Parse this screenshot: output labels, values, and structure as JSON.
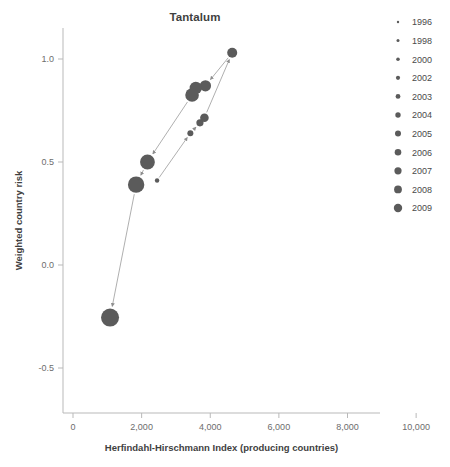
{
  "chart_data": {
    "type": "scatter",
    "title": "Tantalum",
    "xlabel": "Herfindahl-Hirschmann Index (producing countries)",
    "ylabel": "Weighted country risk",
    "xlim": [
      0,
      10400
    ],
    "ylim": [
      -0.72,
      1.16
    ],
    "xticks": [
      0,
      2000,
      4000,
      6000,
      8000,
      10000
    ],
    "xticklabels": [
      "0",
      "2,000",
      "4,000",
      "6,000",
      "8,000",
      "10,000"
    ],
    "yticks": [
      1.0,
      0.5,
      0.0,
      -0.5
    ],
    "yticklabels": [
      "1.0",
      "0.5",
      "0.0",
      "-0.5"
    ],
    "grid": false,
    "legend_position": "right",
    "marker_color": "#5b5b5b",
    "connector_color": "#9a9a9a",
    "series_name": "Tantalum trajectory",
    "points": [
      {
        "label": "1996",
        "x": 2450,
        "y": 0.41,
        "size": 2.2
      },
      {
        "label": "1998",
        "x": 3420,
        "y": 0.64,
        "size": 3.0
      },
      {
        "label": "2000",
        "x": 3700,
        "y": 0.69,
        "size": 3.6
      },
      {
        "label": "2002",
        "x": 3830,
        "y": 0.715,
        "size": 4.3
      },
      {
        "label": "2003",
        "x": 4640,
        "y": 1.03,
        "size": 5.0
      },
      {
        "label": "2004",
        "x": 3860,
        "y": 0.87,
        "size": 5.6
      },
      {
        "label": "2005",
        "x": 3580,
        "y": 0.86,
        "size": 6.2
      },
      {
        "label": "2006",
        "x": 3470,
        "y": 0.825,
        "size": 6.8
      },
      {
        "label": "2007",
        "x": 2170,
        "y": 0.5,
        "size": 7.4
      },
      {
        "label": "2008",
        "x": 1840,
        "y": 0.39,
        "size": 8.2
      },
      {
        "label": "2009",
        "x": 1080,
        "y": -0.255,
        "size": 9.0
      }
    ]
  },
  "legend": {
    "entries": [
      {
        "label": "1996",
        "size": 1.6
      },
      {
        "label": "1998",
        "size": 2.2
      },
      {
        "label": "2000",
        "size": 2.8
      },
      {
        "label": "2002",
        "size": 3.4
      },
      {
        "label": "2003",
        "size": 4.0
      },
      {
        "label": "2004",
        "size": 4.6
      },
      {
        "label": "2005",
        "size": 5.2
      },
      {
        "label": "2006",
        "size": 5.8
      },
      {
        "label": "2007",
        "size": 6.4
      },
      {
        "label": "2008",
        "size": 7.0
      },
      {
        "label": "2009",
        "size": 7.6
      }
    ]
  }
}
